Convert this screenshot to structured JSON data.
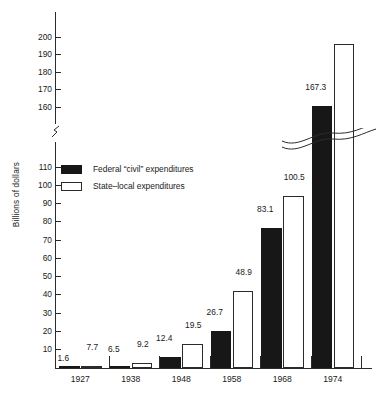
{
  "chart_data": {
    "type": "bar",
    "title": "",
    "subtitle": "",
    "xlabel": "",
    "ylabel": "Billions of dollars",
    "categories": [
      "1927",
      "1938",
      "1948",
      "1958",
      "1968",
      "1974"
    ],
    "series": [
      {
        "name": "Federal “civil” expenditures",
        "color": "#171717",
        "style": "filled-black",
        "values": [
          1.6,
          6.5,
          12.4,
          26.7,
          83.1,
          167.3
        ],
        "value_labels": [
          "1.6",
          "6.5",
          "12.4",
          "26.7",
          "83.1",
          "167.3"
        ]
      },
      {
        "name": "State–local expenditures",
        "color": "#ffffff",
        "style": "outlined-white",
        "values": [
          7.7,
          9.2,
          19.5,
          48.9,
          100.5,
          203.0
        ],
        "value_labels": [
          "7.7",
          "9.2",
          "19.5",
          "48.9",
          "100.5",
          ""
        ]
      }
    ],
    "ylim": [
      0,
      205
    ],
    "ytick_labels": [
      "10",
      "20",
      "30",
      "40",
      "50",
      "60",
      "70",
      "80",
      "90",
      "100",
      "110",
      "160",
      "170",
      "180",
      "190",
      "200"
    ],
    "ytick_values": [
      10,
      20,
      30,
      40,
      50,
      60,
      70,
      80,
      90,
      100,
      110,
      160,
      170,
      180,
      190,
      200
    ],
    "axis_break": {
      "present": true,
      "between": [
        110,
        160
      ],
      "note": "y-axis broken between 110 and 160; wave glyph crosses 1974 bars"
    },
    "grid": false,
    "legend_position": "inside-upper-left"
  },
  "legend": {
    "entries": [
      {
        "label": "Federal “civil” expenditures",
        "swatch": "filled-black"
      },
      {
        "label": "State–local expenditures",
        "swatch": "outlined-white"
      }
    ]
  },
  "axes": {
    "y_title": "Billions of dollars",
    "y_ticks": [
      {
        "label": "200",
        "value": 200
      },
      {
        "label": "190",
        "value": 190
      },
      {
        "label": "180",
        "value": 180
      },
      {
        "label": "170",
        "value": 170
      },
      {
        "label": "160",
        "value": 160
      },
      {
        "label": "110",
        "value": 110
      },
      {
        "label": "100",
        "value": 100
      },
      {
        "label": "90",
        "value": 90
      },
      {
        "label": "80",
        "value": 80
      },
      {
        "label": "70",
        "value": 70
      },
      {
        "label": "60",
        "value": 60
      },
      {
        "label": "50",
        "value": 50
      },
      {
        "label": "40",
        "value": 40
      },
      {
        "label": "30",
        "value": 30
      },
      {
        "label": "20",
        "value": 20
      },
      {
        "label": "10",
        "value": 10
      }
    ],
    "x_categories": [
      "1927",
      "1938",
      "1948",
      "1958",
      "1968",
      "1974"
    ]
  }
}
